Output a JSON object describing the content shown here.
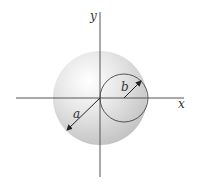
{
  "diagram": {
    "labels": {
      "y_axis": "y",
      "x_axis": "x",
      "radius_a": "a",
      "radius_b": "b"
    },
    "elements": {
      "sphere": {
        "name": "sphere of radius a",
        "cx": 100,
        "cy": 98,
        "r": 47
      },
      "inner_circle": {
        "name": "circle of radius b",
        "cx": 124,
        "cy": 98,
        "r": 24
      },
      "x_axis": {
        "x1": 16,
        "x2": 184,
        "y": 98
      },
      "y_axis": {
        "x": 100,
        "y1": 12,
        "y2": 177
      }
    },
    "colors": {
      "axis": "#555555",
      "sphere_light": "#f4f4f4",
      "sphere_dark": "#c9c9c9",
      "stroke": "#444444"
    }
  }
}
